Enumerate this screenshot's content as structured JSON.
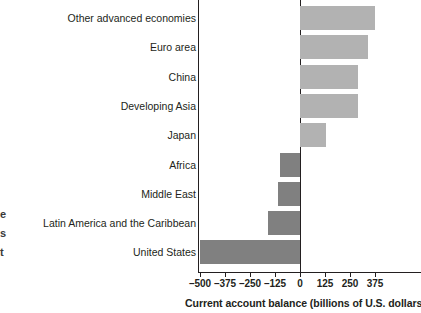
{
  "margin_fragments": [
    "e",
    "s",
    "t"
  ],
  "chart_data": {
    "type": "bar",
    "orientation": "horizontal",
    "title": "",
    "xlabel": "Current account balance (billions of U.S. dollars)",
    "ylabel": "",
    "categories": [
      "Other advanced economies",
      "Euro area",
      "China",
      "Developing Asia",
      "Japan",
      "Africa",
      "Middle East",
      "Latin America and the Caribbean",
      "United States"
    ],
    "values": [
      375,
      340,
      290,
      290,
      130,
      -100,
      -110,
      -160,
      -500
    ],
    "xlim": [
      -500,
      420
    ],
    "xticks": [
      -500,
      -375,
      -250,
      -125,
      0,
      125,
      250,
      375
    ],
    "xticklabels": [
      "–500",
      "–375",
      "–250",
      "–125",
      "0",
      "125",
      "250",
      "375"
    ],
    "grid": false,
    "legend": null,
    "colors": {
      "positive_bar": "#b2b2b2",
      "negative_bar": "#808080",
      "axis": "#231f20",
      "text": "#231f20",
      "background": "#ffffff"
    }
  }
}
